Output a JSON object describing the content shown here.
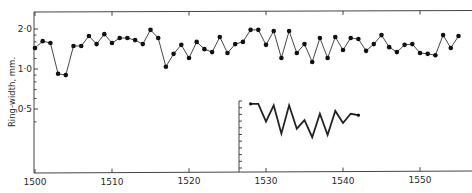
{
  "chart_data": {
    "type": "line",
    "title": "",
    "xlabel": "",
    "ylabel": "Ring-width, mm.",
    "yscale": "log",
    "xlim": [
      1500,
      1556
    ],
    "ylim": [
      0.3,
      2.5
    ],
    "grid": false,
    "legend": null,
    "x_ticks": [
      1500,
      1510,
      1520,
      1530,
      1540,
      1550
    ],
    "x_tick_labels": [
      "1500",
      "1510",
      "1520",
      "1530",
      "1540",
      "1550"
    ],
    "y_ticks": [
      2.0,
      1.0,
      0.5
    ],
    "y_tick_labels": [
      "2·0",
      "1·0",
      "0·5"
    ],
    "series": [
      {
        "name": "ring-width",
        "marker": "dot",
        "x": [
          1500,
          1501,
          1502,
          1503,
          1504,
          1505,
          1506,
          1507,
          1508,
          1509,
          1510,
          1511,
          1512,
          1513,
          1514,
          1515,
          1516,
          1517,
          1518,
          1519,
          1520,
          1521,
          1522,
          1523,
          1524,
          1525,
          1526,
          1527,
          1528,
          1529,
          1530,
          1531,
          1532,
          1533,
          1534,
          1535,
          1536,
          1537,
          1538,
          1539,
          1540,
          1541,
          1542,
          1543,
          1544,
          1545,
          1546,
          1547,
          1548,
          1549,
          1550,
          1551,
          1552,
          1553,
          1554,
          1555
        ],
        "values": [
          1.44,
          1.62,
          1.57,
          0.92,
          0.9,
          1.49,
          1.49,
          1.77,
          1.54,
          1.83,
          1.57,
          1.71,
          1.71,
          1.65,
          1.54,
          1.97,
          1.71,
          1.04,
          1.3,
          1.52,
          1.21,
          1.6,
          1.41,
          1.34,
          1.74,
          1.32,
          1.54,
          1.6,
          1.97,
          1.97,
          1.52,
          1.93,
          1.21,
          1.93,
          1.32,
          1.54,
          1.13,
          1.71,
          1.21,
          1.74,
          1.39,
          1.71,
          1.68,
          1.37,
          1.54,
          1.8,
          1.46,
          1.34,
          1.52,
          1.54,
          1.32,
          1.3,
          1.27,
          1.8,
          1.44,
          1.77
        ]
      }
    ],
    "inset": {
      "description": "superimposed bold curve with its own unlabeled vertical axis (minor ticks only)",
      "x": [
        1528,
        1529,
        1530,
        1531,
        1532,
        1533,
        1534,
        1535,
        1536,
        1537,
        1538,
        1539,
        1540,
        1541,
        1542
      ],
      "relative_height": [
        0.96,
        0.96,
        0.71,
        0.94,
        0.54,
        0.94,
        0.61,
        0.73,
        0.49,
        0.82,
        0.52,
        0.86,
        0.69,
        0.82,
        0.8
      ],
      "axis_ticks": 10
    }
  },
  "layout": {
    "plot": {
      "left": 34,
      "top": 12,
      "right": 472,
      "bottom": 173
    },
    "x_px": {
      "x0": 1500,
      "px0": 35,
      "px_per_unit": 7.7
    },
    "y_px": {
      "ref_value": 1.0,
      "ref_px": 69,
      "px_per_octave": 40
    },
    "inset_axis": {
      "x": 239,
      "top": 101,
      "bottom": 172
    },
    "colors": {
      "ink": "#222222",
      "background": "#ffffff"
    }
  }
}
